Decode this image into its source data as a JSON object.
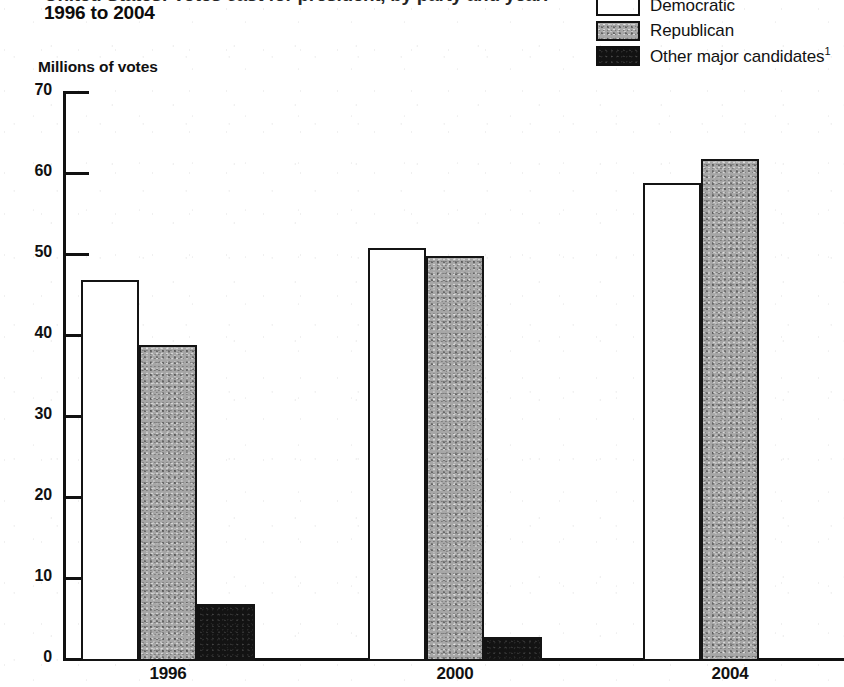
{
  "header": {
    "title_clipped_line": "United States: Votes cast for president, by party and year:",
    "title_main": "1996 to 2004"
  },
  "legend": {
    "items": [
      {
        "label": "Democratic",
        "swatch": "white-outlined-square",
        "color": "#ffffff"
      },
      {
        "label": "Republican",
        "swatch": "gray-filled-square",
        "color": "#a6a6a6"
      },
      {
        "label": "Other major candidates",
        "footnote": "1",
        "swatch": "black-filled-square",
        "color": "#131313"
      }
    ]
  },
  "chart_data": {
    "type": "bar",
    "title": "1996 to 2004",
    "xlabel": "",
    "ylabel": "Millions of votes",
    "categories": [
      "1996",
      "2000",
      "2004"
    ],
    "series": [
      {
        "name": "Democratic",
        "values": [
          47,
          51,
          59
        ],
        "color": "#ffffff"
      },
      {
        "name": "Republican",
        "values": [
          39,
          50,
          62
        ],
        "color": "#a6a6a6"
      },
      {
        "name": "Other major candidates",
        "values": [
          7,
          3,
          0
        ],
        "color": "#131313"
      }
    ],
    "ylim": [
      0,
      70
    ],
    "yticks": [
      0,
      10,
      20,
      30,
      40,
      50,
      60,
      70
    ],
    "ytick_labels": [
      "0",
      "10",
      "20",
      "30",
      "40",
      "50",
      "60",
      "70"
    ],
    "grid": false,
    "legend_position": "top-right",
    "units": "millions"
  }
}
